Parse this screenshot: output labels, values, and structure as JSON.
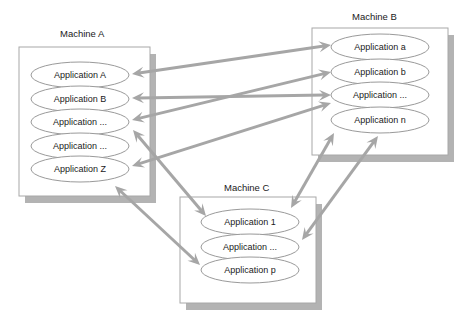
{
  "diagram": {
    "machines": [
      {
        "id": "A",
        "title": "Machine A",
        "box": {
          "x": 19,
          "y": 47,
          "w": 131,
          "h": 149
        },
        "title_pos": {
          "x": 60,
          "y": 37
        },
        "apps": [
          {
            "label": "Application A",
            "cx": 80,
            "cy": 75
          },
          {
            "label": "Application B",
            "cx": 80,
            "cy": 99
          },
          {
            "label": "Application ...",
            "cx": 80,
            "cy": 122
          },
          {
            "label": "Application ...",
            "cx": 80,
            "cy": 146
          },
          {
            "label": "Application Z",
            "cx": 80,
            "cy": 169
          }
        ]
      },
      {
        "id": "B",
        "title": "Machine B",
        "box": {
          "x": 312,
          "y": 28,
          "w": 136,
          "h": 127
        },
        "title_pos": {
          "x": 352,
          "y": 20
        },
        "apps": [
          {
            "label": "Application a",
            "cx": 380,
            "cy": 47
          },
          {
            "label": "Application b",
            "cx": 380,
            "cy": 72
          },
          {
            "label": "Application ...",
            "cx": 380,
            "cy": 95
          },
          {
            "label": "Application n",
            "cx": 380,
            "cy": 120
          }
        ]
      },
      {
        "id": "C",
        "title": "Machine C",
        "box": {
          "x": 180,
          "y": 197,
          "w": 136,
          "h": 106
        },
        "title_pos": {
          "x": 224,
          "y": 191
        },
        "apps": [
          {
            "label": "Application 1",
            "cx": 250,
            "cy": 222
          },
          {
            "label": "Application ...",
            "cx": 250,
            "cy": 247
          },
          {
            "label": "Application p",
            "cx": 250,
            "cy": 270
          }
        ]
      }
    ],
    "connections": [
      {
        "from": "A: Application A",
        "to": "B: Application a",
        "x1": 132,
        "y1": 74,
        "x2": 331,
        "y2": 45
      },
      {
        "from": "A: Application B",
        "to": "B: Application ...",
        "x1": 132,
        "y1": 98,
        "x2": 331,
        "y2": 95
      },
      {
        "from": "A: Application ...",
        "to": "B: Application b",
        "x1": 132,
        "y1": 120,
        "x2": 331,
        "y2": 72
      },
      {
        "from": "A: Application Z",
        "to": "B: Application ...",
        "x1": 132,
        "y1": 166,
        "x2": 331,
        "y2": 103
      },
      {
        "from": "A: Application ...",
        "to": "C: Application 1",
        "x1": 133,
        "y1": 130,
        "x2": 206,
        "y2": 216
      },
      {
        "from": "A: Application Z",
        "to": "C: Application p",
        "x1": 115,
        "y1": 186,
        "x2": 200,
        "y2": 265
      },
      {
        "from": "B: Application n",
        "to": "C: Application 1",
        "x1": 334,
        "y1": 133,
        "x2": 291,
        "y2": 208
      },
      {
        "from": "B: Application n",
        "to": "C: Application ...",
        "x1": 378,
        "y1": 136,
        "x2": 302,
        "y2": 240
      }
    ],
    "colors": {
      "arrow": "#a6a6a6",
      "shadow": "#b3b3b3",
      "box_border": "#a8a8a8",
      "ellipse_border": "#9a9a9a"
    }
  }
}
